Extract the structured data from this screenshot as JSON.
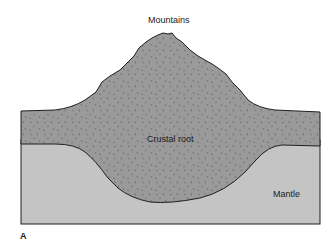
{
  "diagram": {
    "labels": {
      "mountains": "Mountains",
      "crustal_root": "Crustal root",
      "mantle": "Mantle",
      "panel": "A"
    },
    "colors": {
      "crust": "#9a9a9a",
      "mantle": "#c4c4c4",
      "outline": "#1f1f1f",
      "speckle": "#5a5a5a",
      "background": "#ffffff"
    }
  }
}
